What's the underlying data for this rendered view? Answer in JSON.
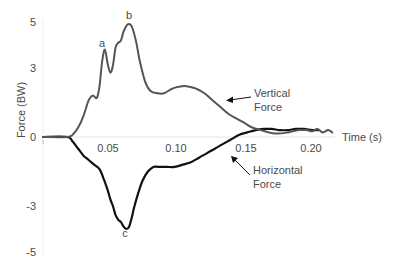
{
  "chart_data": {
    "type": "line",
    "title": "",
    "xlabel": "Time (s)",
    "ylabel": "Force (BW)",
    "xlim": [
      0,
      0.22
    ],
    "ylim": [
      -5,
      5
    ],
    "x_ticks": [
      "0.05",
      "0.10",
      "0.15",
      "0.20"
    ],
    "x_tick_values": [
      0.05,
      0.1,
      0.15,
      0.2
    ],
    "y_ticks": [
      "5",
      "3",
      "0",
      "-3",
      "-5"
    ],
    "y_tick_values": [
      5,
      3,
      0,
      -3,
      -5
    ],
    "grid": false,
    "series": [
      {
        "name": "Vertical Force",
        "color": "#555555",
        "points": [
          [
            0.0,
            0.0
          ],
          [
            0.018,
            0.0
          ],
          [
            0.022,
            0.1
          ],
          [
            0.026,
            0.4
          ],
          [
            0.03,
            0.9
          ],
          [
            0.034,
            1.6
          ],
          [
            0.037,
            1.8
          ],
          [
            0.04,
            1.7
          ],
          [
            0.042,
            2.2
          ],
          [
            0.044,
            3.3
          ],
          [
            0.046,
            3.8
          ],
          [
            0.048,
            3.2
          ],
          [
            0.05,
            2.8
          ],
          [
            0.052,
            3.1
          ],
          [
            0.054,
            3.9
          ],
          [
            0.056,
            4.1
          ],
          [
            0.058,
            4.2
          ],
          [
            0.06,
            4.6
          ],
          [
            0.063,
            4.9
          ],
          [
            0.066,
            4.8
          ],
          [
            0.069,
            4.2
          ],
          [
            0.072,
            3.3
          ],
          [
            0.076,
            2.4
          ],
          [
            0.08,
            2.0
          ],
          [
            0.085,
            1.9
          ],
          [
            0.09,
            1.9
          ],
          [
            0.096,
            2.1
          ],
          [
            0.102,
            2.2
          ],
          [
            0.108,
            2.2
          ],
          [
            0.114,
            2.1
          ],
          [
            0.12,
            1.9
          ],
          [
            0.126,
            1.6
          ],
          [
            0.132,
            1.3
          ],
          [
            0.138,
            1.0
          ],
          [
            0.144,
            0.8
          ],
          [
            0.15,
            0.6
          ],
          [
            0.156,
            0.4
          ],
          [
            0.162,
            0.3
          ],
          [
            0.168,
            0.2
          ],
          [
            0.175,
            0.15
          ],
          [
            0.182,
            0.2
          ],
          [
            0.19,
            0.3
          ],
          [
            0.196,
            0.3
          ],
          [
            0.2,
            0.25
          ],
          [
            0.204,
            0.35
          ],
          [
            0.208,
            0.2
          ],
          [
            0.212,
            0.3
          ],
          [
            0.215,
            0.2
          ]
        ]
      },
      {
        "name": "Horizontal Force",
        "color": "#111111",
        "points": [
          [
            0.0,
            0.0
          ],
          [
            0.018,
            0.0
          ],
          [
            0.022,
            -0.2
          ],
          [
            0.026,
            -0.5
          ],
          [
            0.03,
            -0.8
          ],
          [
            0.034,
            -1.0
          ],
          [
            0.038,
            -1.2
          ],
          [
            0.042,
            -1.4
          ],
          [
            0.045,
            -1.8
          ],
          [
            0.048,
            -2.3
          ],
          [
            0.05,
            -2.7
          ],
          [
            0.052,
            -3.0
          ],
          [
            0.054,
            -3.4
          ],
          [
            0.056,
            -3.6
          ],
          [
            0.058,
            -3.7
          ],
          [
            0.06,
            -3.9
          ],
          [
            0.062,
            -4.0
          ],
          [
            0.064,
            -3.9
          ],
          [
            0.066,
            -3.5
          ],
          [
            0.068,
            -3.0
          ],
          [
            0.071,
            -2.4
          ],
          [
            0.074,
            -1.9
          ],
          [
            0.078,
            -1.5
          ],
          [
            0.082,
            -1.3
          ],
          [
            0.086,
            -1.3
          ],
          [
            0.092,
            -1.3
          ],
          [
            0.098,
            -1.3
          ],
          [
            0.104,
            -1.2
          ],
          [
            0.11,
            -1.1
          ],
          [
            0.116,
            -0.9
          ],
          [
            0.122,
            -0.7
          ],
          [
            0.128,
            -0.5
          ],
          [
            0.134,
            -0.3
          ],
          [
            0.14,
            -0.1
          ],
          [
            0.146,
            0.1
          ],
          [
            0.152,
            0.2
          ],
          [
            0.158,
            0.3
          ],
          [
            0.164,
            0.35
          ],
          [
            0.17,
            0.35
          ],
          [
            0.176,
            0.3
          ],
          [
            0.182,
            0.3
          ],
          [
            0.188,
            0.35
          ],
          [
            0.194,
            0.35
          ],
          [
            0.2,
            0.3
          ],
          [
            0.205,
            0.3
          ]
        ]
      }
    ],
    "annotations": [
      {
        "label": "a",
        "x": 0.046,
        "y": 3.8,
        "note": "first vertical peak"
      },
      {
        "label": "b",
        "x": 0.063,
        "y": 4.9,
        "note": "vertical maximum"
      },
      {
        "label": "c",
        "x": 0.062,
        "y": -4.0,
        "note": "horizontal minimum"
      }
    ],
    "callouts": [
      {
        "lines": [
          "Vertical",
          "Force"
        ],
        "series": "Vertical Force"
      },
      {
        "lines": [
          "Horizontal",
          "Force"
        ],
        "series": "Horizontal Force"
      }
    ]
  },
  "labels": {
    "y_axis": "Force (BW)",
    "x_axis": "Time (s)",
    "vertical_line1": "Vertical",
    "vertical_line2": "Force",
    "horizontal_line1": "Horizontal",
    "horizontal_line2": "Force",
    "peak_a": "a",
    "peak_b": "b",
    "peak_c": "c",
    "tick_x_005": "0.05",
    "tick_x_010": "0.10",
    "tick_x_015": "0.15",
    "tick_x_020": "0.20",
    "tick_y_5": "5",
    "tick_y_3": "3",
    "tick_y_0": "0",
    "tick_y_m3": "-3",
    "tick_y_m5": "-5"
  }
}
